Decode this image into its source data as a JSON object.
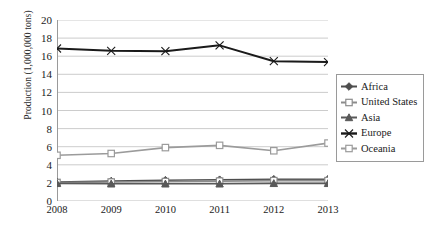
{
  "chart_data": {
    "type": "line",
    "title": "",
    "xlabel": "",
    "ylabel": "Production (1,000,000 tons)",
    "categories": [
      "2008",
      "2009",
      "2010",
      "2011",
      "2012",
      "2013"
    ],
    "x": [
      2008,
      2009,
      2010,
      2011,
      2012,
      2013
    ],
    "ylim": [
      0,
      20
    ],
    "ytick_step": 2,
    "yticks": [
      "20",
      "18",
      "16",
      "14",
      "12",
      "10",
      "8",
      "6",
      "4",
      "2",
      "0"
    ],
    "grid": "horizontal",
    "legend_position": "right",
    "series": [
      {
        "name": "Africa",
        "color": "#4d4d4d",
        "marker": "diamond",
        "values": [
          2.1,
          2.2,
          2.3,
          2.35,
          2.4,
          2.4
        ]
      },
      {
        "name": "United States",
        "color": "#8c8c8c",
        "marker": "square",
        "values": [
          2.05,
          2.1,
          2.15,
          2.2,
          2.25,
          2.25
        ]
      },
      {
        "name": "Asia",
        "color": "#595959",
        "marker": "triangle",
        "values": [
          1.95,
          1.9,
          1.9,
          1.9,
          1.95,
          1.95
        ]
      },
      {
        "name": "Europe",
        "color": "#1a1a1a",
        "marker": "cross",
        "values": [
          16.85,
          16.6,
          16.55,
          17.2,
          15.45,
          15.35
        ]
      },
      {
        "name": "Oceania",
        "color": "#9b9b9b",
        "marker": "square",
        "values": [
          5.05,
          5.25,
          5.9,
          6.15,
          5.55,
          6.4
        ]
      }
    ]
  },
  "legend": {
    "items": [
      {
        "label": "Africa"
      },
      {
        "label": "United States"
      },
      {
        "label": "Asia"
      },
      {
        "label": "Europe"
      },
      {
        "label": "Oceania"
      }
    ]
  }
}
